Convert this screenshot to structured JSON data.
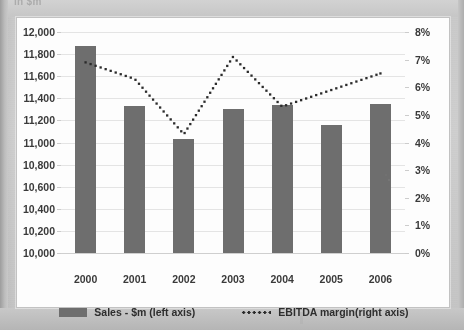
{
  "document": {
    "clipped_heading": "in $m",
    "page_background": "#c9c9c9",
    "card_background": "#fdfdfd"
  },
  "colors": {
    "bar": "#6e6e6e",
    "line": "#2b2b2b",
    "gridline": "#e4e4e4",
    "axis_text": "#3a3a3a"
  },
  "legend": {
    "position": "bottom-center",
    "entries": [
      {
        "label": "Sales - $m (left axis)",
        "marker": "bar-swatch",
        "color": "#6e6e6e"
      },
      {
        "label": "EBITDA margin(right axis)",
        "marker": "dotted-line-swatch",
        "color": "#2b2b2b"
      }
    ]
  },
  "chart_data": {
    "type": "bar",
    "title": "",
    "subtitle": "",
    "xlabel": "",
    "ylabel": "",
    "grid": true,
    "legend_position": "bottom",
    "categories": [
      "2000",
      "2001",
      "2002",
      "2003",
      "2004",
      "2005",
      "2006"
    ],
    "series": [
      {
        "name": "Sales - $m (left axis)",
        "type": "bar",
        "axis": "left",
        "color": "#6e6e6e",
        "values": [
          11870,
          11330,
          11030,
          11300,
          11340,
          11160,
          11350
        ]
      },
      {
        "name": "EBITDA margin(right axis)",
        "type": "line",
        "style": "dotted",
        "axis": "right",
        "color": "#2b2b2b",
        "values": [
          6.9,
          6.3,
          4.3,
          7.1,
          5.3,
          5.9,
          6.5
        ]
      }
    ],
    "left_axis": {
      "label": "Sales - $m",
      "min": 10000,
      "max": 12000,
      "step": 200,
      "ticks": [
        "10,000",
        "10,200",
        "10,400",
        "10,600",
        "10,800",
        "11,000",
        "11,200",
        "11,400",
        "11,600",
        "11,800",
        "12,000"
      ]
    },
    "right_axis": {
      "label": "EBITDA margin",
      "min": 0,
      "max": 8,
      "step": 1,
      "unit": "%",
      "ticks": [
        "0%",
        "1%",
        "2%",
        "3%",
        "4%",
        "5%",
        "6%",
        "7%",
        "8%"
      ]
    }
  }
}
